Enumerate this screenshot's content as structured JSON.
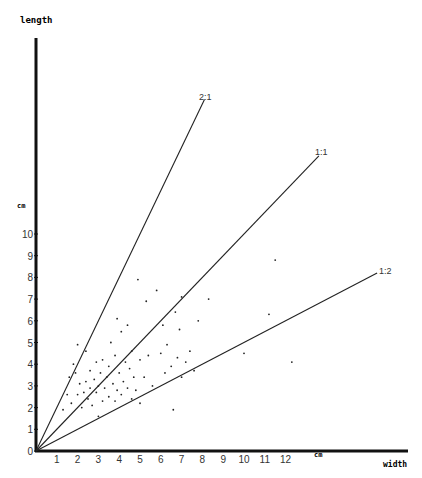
{
  "chart_data": {
    "type": "scatter",
    "title": "",
    "xlabel": "width",
    "ylabel": "length",
    "x_unit": "cm",
    "y_unit": "cm",
    "xlim": [
      0,
      14.8
    ],
    "ylim": [
      0,
      19.3
    ],
    "grid": false,
    "legend": null,
    "x_ticks": [
      "1",
      "2",
      "3",
      "4",
      "5",
      "6",
      "7",
      "8",
      "9",
      "10",
      "11",
      "12"
    ],
    "y_ticks": [
      "0",
      "1",
      "2",
      "3",
      "4",
      "5",
      "6",
      "7",
      "8",
      "9",
      "10"
    ],
    "reference_lines": [
      {
        "label": "2:1",
        "slope": 2.0,
        "x_end": 8.1
      },
      {
        "label": "1:1",
        "slope": 1.0,
        "x_end": 13.6
      },
      {
        "label": "1:2",
        "slope": 0.5,
        "x_end": 16.4
      }
    ],
    "points": [
      [
        1.3,
        1.9
      ],
      [
        1.5,
        2.6
      ],
      [
        1.6,
        3.4
      ],
      [
        1.7,
        2.2
      ],
      [
        1.8,
        4.0
      ],
      [
        1.9,
        3.6
      ],
      [
        2.0,
        2.6
      ],
      [
        2.0,
        4.9
      ],
      [
        2.1,
        3.1
      ],
      [
        2.2,
        2.0
      ],
      [
        2.3,
        2.7
      ],
      [
        2.4,
        3.2
      ],
      [
        2.4,
        4.6
      ],
      [
        2.5,
        2.4
      ],
      [
        2.6,
        2.9
      ],
      [
        2.6,
        3.7
      ],
      [
        2.7,
        2.1
      ],
      [
        2.8,
        3.3
      ],
      [
        2.9,
        2.7
      ],
      [
        2.9,
        4.1
      ],
      [
        3.0,
        1.6
      ],
      [
        3.0,
        3.0
      ],
      [
        3.1,
        3.6
      ],
      [
        3.2,
        2.3
      ],
      [
        3.2,
        4.2
      ],
      [
        3.3,
        2.9
      ],
      [
        3.4,
        3.4
      ],
      [
        3.5,
        2.5
      ],
      [
        3.5,
        3.9
      ],
      [
        3.6,
        5.0
      ],
      [
        3.7,
        3.1
      ],
      [
        3.8,
        2.3
      ],
      [
        3.8,
        4.4
      ],
      [
        3.9,
        2.8
      ],
      [
        3.9,
        6.1
      ],
      [
        4.0,
        3.6
      ],
      [
        4.1,
        2.6
      ],
      [
        4.1,
        5.5
      ],
      [
        4.2,
        3.2
      ],
      [
        4.3,
        4.1
      ],
      [
        4.4,
        2.9
      ],
      [
        4.4,
        5.8
      ],
      [
        4.5,
        3.8
      ],
      [
        4.6,
        2.4
      ],
      [
        4.6,
        4.6
      ],
      [
        4.7,
        3.4
      ],
      [
        4.8,
        2.8
      ],
      [
        4.9,
        7.9
      ],
      [
        5.0,
        2.2
      ],
      [
        5.0,
        4.2
      ],
      [
        5.2,
        3.4
      ],
      [
        5.3,
        6.9
      ],
      [
        5.4,
        4.4
      ],
      [
        5.6,
        3.0
      ],
      [
        5.8,
        7.4
      ],
      [
        6.0,
        4.5
      ],
      [
        6.1,
        5.8
      ],
      [
        6.2,
        3.6
      ],
      [
        6.3,
        4.9
      ],
      [
        6.5,
        3.9
      ],
      [
        6.6,
        1.9
      ],
      [
        6.7,
        6.4
      ],
      [
        6.8,
        4.3
      ],
      [
        6.9,
        5.6
      ],
      [
        7.0,
        3.4
      ],
      [
        7.0,
        7.1
      ],
      [
        7.2,
        4.1
      ],
      [
        7.4,
        4.6
      ],
      [
        7.6,
        3.7
      ],
      [
        7.8,
        6.0
      ],
      [
        8.3,
        7.0
      ],
      [
        10.0,
        4.5
      ],
      [
        11.2,
        6.3
      ],
      [
        11.5,
        8.8
      ],
      [
        12.3,
        4.1
      ]
    ]
  },
  "labels": {
    "y_axis_title": "length",
    "y_unit": "cm",
    "x_unit": "cm",
    "x_axis_title": "width",
    "line_2_1": "2:1",
    "line_1_1": "1:1",
    "line_1_2": "1:2"
  }
}
